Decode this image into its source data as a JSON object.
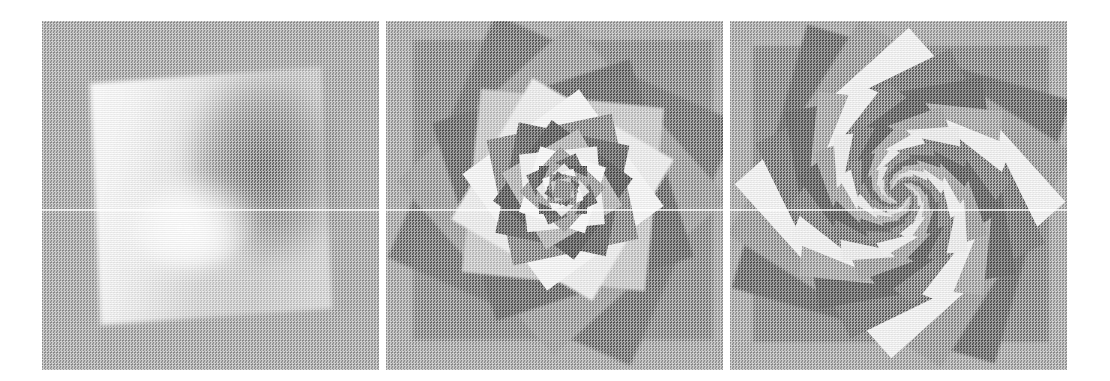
{
  "figure": {
    "background_color": "#ffffff",
    "panel_background": "#a9a9a9",
    "panel_count": 3,
    "image_width": 1110,
    "image_height": 381,
    "scan_artifact": "horizontal bright scan line at y=209",
    "halftone": "dithered checkerboard scan texture over entire figure"
  },
  "panels": [
    {
      "id": "panel-1",
      "label": "",
      "iterations": 1,
      "description": "Single large rotated square with a smooth continuous grayscale gradient; bright lobe upper-left, dark region right, soft light hook curving near the centre",
      "square_rotation_deg": -4,
      "square_size_px": 232,
      "tone_light": "#f6f6f6",
      "tone_mid": "#c6c6c6",
      "tone_dark": "#767676"
    },
    {
      "id": "panel-2",
      "label": "",
      "iterations": 12,
      "description": "Spiral of overlapping rotated and scaled squares forming a logarithmic spiral converging to the centre; sawtooth outer silhouette",
      "rotation_step_deg": 24,
      "scale_step": 0.84,
      "tone_light": "#fafafa",
      "tone_mid": "#b0b0b0",
      "tone_dark": "#6e6e6e"
    },
    {
      "id": "panel-3",
      "label": "",
      "iterations": 26,
      "description": "Dense rosette of rotating squares producing sharp triangular facets radiating outward from a tight recursive centre",
      "rotation_step_deg": 16,
      "scale_step": 0.9,
      "tone_light": "#fbfbfb",
      "tone_mid": "#b6b6b6",
      "tone_dark": "#707070"
    }
  ],
  "geometry": {
    "panel_left": 42,
    "panel_top": 21,
    "panel_width": 337,
    "panel_height": 349,
    "panel_gap": 7,
    "scanline_y": 188
  },
  "spiral_layers": {
    "panel2": [
      {
        "rot": 0,
        "scale": 1.0,
        "tone": "#8d8d8d"
      },
      {
        "rot": 24,
        "scale": 0.885,
        "tone": "#787878"
      },
      {
        "rot": 48,
        "scale": 0.783,
        "tone": "#9e9e9e"
      },
      {
        "rot": 72,
        "scale": 0.693,
        "tone": "#6f6f6f"
      },
      {
        "rot": 96,
        "scale": 0.613,
        "tone": "#c9c9c9"
      },
      {
        "rot": 120,
        "scale": 0.543,
        "tone": "#ededed"
      },
      {
        "rot": 144,
        "scale": 0.48,
        "tone": "#f7f7f7"
      },
      {
        "rot": 168,
        "scale": 0.425,
        "tone": "#8a8a8a"
      },
      {
        "rot": 192,
        "scale": 0.376,
        "tone": "#6b6b6b"
      },
      {
        "rot": 216,
        "scale": 0.333,
        "tone": "#5f5f5f"
      },
      {
        "rot": 240,
        "scale": 0.294,
        "tone": "#b5b5b5"
      },
      {
        "rot": 264,
        "scale": 0.261,
        "tone": "#f2f2f2"
      },
      {
        "rot": 288,
        "scale": 0.231,
        "tone": "#fbfbfb"
      },
      {
        "rot": 312,
        "scale": 0.204,
        "tone": "#9c9c9c"
      },
      {
        "rot": 336,
        "scale": 0.181,
        "tone": "#6a6a6a"
      },
      {
        "rot": 360,
        "scale": 0.16,
        "tone": "#5c5c5c"
      },
      {
        "rot": 384,
        "scale": 0.142,
        "tone": "#a0a0a0"
      },
      {
        "rot": 408,
        "scale": 0.125,
        "tone": "#e8e8e8"
      },
      {
        "rot": 432,
        "scale": 0.111,
        "tone": "#fafafa"
      },
      {
        "rot": 456,
        "scale": 0.098,
        "tone": "#8f8f8f"
      },
      {
        "rot": 480,
        "scale": 0.087,
        "tone": "#666666"
      },
      {
        "rot": 504,
        "scale": 0.077,
        "tone": "#828282"
      },
      {
        "rot": 528,
        "scale": 0.068,
        "tone": "#c4c4c4"
      },
      {
        "rot": 552,
        "scale": 0.06,
        "tone": "#8b8b8b"
      }
    ],
    "panel3": [
      {
        "rot": 0,
        "scale": 1.0,
        "tone": "#8a8a8a"
      },
      {
        "rot": 16,
        "scale": 0.925,
        "tone": "#6f6f6f"
      },
      {
        "rot": 32,
        "scale": 0.856,
        "tone": "#9b9b9b"
      },
      {
        "rot": 48,
        "scale": 0.791,
        "tone": "#f4f4f4"
      },
      {
        "rot": 64,
        "scale": 0.732,
        "tone": "#7a7a7a"
      },
      {
        "rot": 80,
        "scale": 0.677,
        "tone": "#676767"
      },
      {
        "rot": 96,
        "scale": 0.626,
        "tone": "#a8a8a8"
      },
      {
        "rot": 112,
        "scale": 0.579,
        "tone": "#f2f2f2"
      },
      {
        "rot": 128,
        "scale": 0.536,
        "tone": "#818181"
      },
      {
        "rot": 144,
        "scale": 0.495,
        "tone": "#646464"
      },
      {
        "rot": 160,
        "scale": 0.458,
        "tone": "#9e9e9e"
      },
      {
        "rot": 176,
        "scale": 0.424,
        "tone": "#ededed"
      },
      {
        "rot": 192,
        "scale": 0.392,
        "tone": "#7d7d7d"
      },
      {
        "rot": 208,
        "scale": 0.362,
        "tone": "#626262"
      },
      {
        "rot": 224,
        "scale": 0.335,
        "tone": "#a4a4a4"
      },
      {
        "rot": 240,
        "scale": 0.31,
        "tone": "#f0f0f0"
      },
      {
        "rot": 256,
        "scale": 0.287,
        "tone": "#858585"
      },
      {
        "rot": 272,
        "scale": 0.265,
        "tone": "#666666"
      },
      {
        "rot": 288,
        "scale": 0.245,
        "tone": "#a9a9a9"
      },
      {
        "rot": 304,
        "scale": 0.227,
        "tone": "#ececec"
      },
      {
        "rot": 320,
        "scale": 0.21,
        "tone": "#888888"
      },
      {
        "rot": 336,
        "scale": 0.194,
        "tone": "#6a6a6a"
      },
      {
        "rot": 352,
        "scale": 0.18,
        "tone": "#aeaeae"
      },
      {
        "rot": 368,
        "scale": 0.166,
        "tone": "#e6e6e6"
      },
      {
        "rot": 384,
        "scale": 0.154,
        "tone": "#8c8c8c"
      },
      {
        "rot": 400,
        "scale": 0.142,
        "tone": "#6e6e6e"
      },
      {
        "rot": 416,
        "scale": 0.132,
        "tone": "#b2b2b2"
      },
      {
        "rot": 432,
        "scale": 0.122,
        "tone": "#e0e0e0"
      },
      {
        "rot": 448,
        "scale": 0.113,
        "tone": "#909090"
      },
      {
        "rot": 464,
        "scale": 0.104,
        "tone": "#727272"
      },
      {
        "rot": 480,
        "scale": 0.097,
        "tone": "#b6b6b6"
      },
      {
        "rot": 496,
        "scale": 0.089,
        "tone": "#d8d8d8"
      },
      {
        "rot": 512,
        "scale": 0.083,
        "tone": "#949494"
      },
      {
        "rot": 528,
        "scale": 0.077,
        "tone": "#767676"
      },
      {
        "rot": 544,
        "scale": 0.071,
        "tone": "#bababa"
      },
      {
        "rot": 560,
        "scale": 0.066,
        "tone": "#d0d0d0"
      },
      {
        "rot": 576,
        "scale": 0.061,
        "tone": "#989898"
      },
      {
        "rot": 592,
        "scale": 0.056,
        "tone": "#7a7a7a"
      }
    ]
  }
}
